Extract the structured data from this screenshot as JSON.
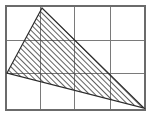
{
  "figure": {
    "canvas": {
      "width": 152,
      "height": 121,
      "background": "#ffffff"
    },
    "grid": {
      "name": "grid-lines",
      "columns": 4,
      "rows": 3,
      "x_lines": [
        6,
        40,
        74,
        110,
        145
      ],
      "y_lines": [
        6,
        40,
        73,
        110
      ],
      "line_color": "#7a7a7a",
      "line_width": 1,
      "border_color": "#6b6b6b",
      "border_width": 1.2
    },
    "triangle": {
      "name": "hatched-triangle",
      "vertices": [
        {
          "label": "apex",
          "x": 42,
          "y": 8
        },
        {
          "label": "left",
          "x": 7,
          "y": 73
        },
        {
          "label": "right",
          "x": 144,
          "y": 108
        }
      ],
      "points_attr": "42,8 7,73 144,108",
      "outline_color": "#2b2b2b",
      "outline_width": 1.2,
      "fill": "hatch",
      "hatch": {
        "angle_deg": 45,
        "direction": "bottom-left-to-top-right",
        "spacing_px": 4,
        "line_color": "#3a3a3a",
        "line_width": 0.8
      }
    }
  }
}
